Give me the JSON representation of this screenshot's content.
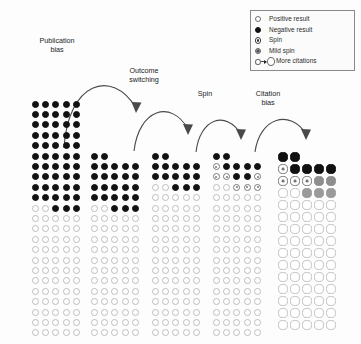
{
  "figure": {
    "title": "",
    "background": "#fdfdfd"
  },
  "legend": {
    "border_color": "#8a8a8a",
    "items": [
      {
        "icon": "open-circle-icon",
        "marker": "positive",
        "label": "Positive result"
      },
      {
        "icon": "filled-circle-icon",
        "marker": "negative",
        "label": "Negative result"
      },
      {
        "icon": "ringed-circle-icon",
        "marker": "spin",
        "label": "Spin"
      },
      {
        "icon": "gray-ringed-circle-icon",
        "marker": "mild_spin",
        "label": "Mild spin"
      },
      {
        "icon": "arrow-to-big-circle-icon",
        "marker": "more_citations",
        "label": "More citations"
      }
    ]
  },
  "stages": [
    {
      "id": "publication-bias",
      "label": "Publication\nbias",
      "x": 56,
      "y": 37
    },
    {
      "id": "outcome-switching",
      "label": "Outcome\nswitching",
      "x": 143,
      "y": 67
    },
    {
      "id": "spin",
      "label": "Spin",
      "x": 206,
      "y": 90
    },
    {
      "id": "citation-bias",
      "label": "Citation\nbias",
      "x": 263,
      "y": 90
    }
  ],
  "arrows": [
    {
      "id": "arrow-publication-bias",
      "from": "column-1",
      "to": "column-2"
    },
    {
      "id": "arrow-outcome-switching",
      "from": "column-2",
      "to": "column-3"
    },
    {
      "id": "arrow-spin",
      "from": "column-3",
      "to": "column-4"
    },
    {
      "id": "arrow-citation-bias",
      "from": "column-4",
      "to": "column-5"
    }
  ],
  "colors": {
    "negative": "#111111",
    "positive_outline": "#bdbdbd",
    "spin": "#777777",
    "mild_spin": "#8e8e8e",
    "text": "#1c1c1c"
  },
  "chart_data": {
    "type": "diagram",
    "cell_codes": {
      "n": "negative",
      "p": "positive",
      "s": "spin",
      "m": "mild_spin",
      "P": "big_positive",
      "S": "big_spin",
      "_": "empty"
    },
    "columns": [
      {
        "id": "column-1",
        "name": "all-conducted-studies",
        "x": 30,
        "y": 99,
        "cell": 10.4,
        "dot": 7.0,
        "rows": [
          "nnnnn",
          "nnnnn",
          "nnnnn",
          "nnnnn",
          "nnnnn",
          "nnnnn",
          "nnnnn",
          "nnnnn",
          "nnnnn",
          "nnnnn",
          "ppnnn",
          "ppppp",
          "ppppp",
          "ppppp",
          "ppppp",
          "ppppp",
          "ppppp",
          "ppppp",
          "ppppp",
          "ppppp",
          "ppppp",
          "ppppp",
          "ppppp"
        ]
      },
      {
        "id": "column-2",
        "name": "published-studies",
        "x": 89,
        "y": 151,
        "cell": 10.4,
        "dot": 7.0,
        "rows": [
          "nn___",
          "nnnnn",
          "nnnnn",
          "nnnnn",
          "nnnnn",
          "ppnnn",
          "ppppp",
          "ppppp",
          "ppppp",
          "ppppp",
          "ppppp",
          "ppppp",
          "ppppp",
          "ppppp",
          "ppppp",
          "ppppp",
          "ppppp",
          "ppppp"
        ]
      },
      {
        "id": "column-3",
        "name": "after-outcome-switching",
        "x": 150,
        "y": 151,
        "cell": 10.4,
        "dot": 7.0,
        "rows": [
          "nn___",
          "nnnnn",
          "nnnnn",
          "ppnnn",
          "ppppp",
          "ppppp",
          "ppppp",
          "ppppp",
          "ppppp",
          "ppppp",
          "ppppp",
          "ppppp",
          "ppppp",
          "ppppp",
          "ppppp",
          "ppppp",
          "ppppp",
          "ppppp"
        ]
      },
      {
        "id": "column-4",
        "name": "after-spin",
        "x": 211,
        "y": 151,
        "cell": 10.4,
        "dot": 7.0,
        "rows": [
          "nn___",
          "snnnn",
          "ssnns",
          "ppsss",
          "ppppp",
          "ppppp",
          "ppppp",
          "ppppp",
          "ppppp",
          "ppppp",
          "ppppp",
          "ppppp",
          "ppppp",
          "ppppp",
          "ppppp",
          "ppppp",
          "ppppp",
          "ppppp"
        ]
      },
      {
        "id": "column-5",
        "name": "after-citation-bias",
        "x": 277,
        "y": 151,
        "cell": 12.0,
        "dot": 9.2,
        "rows": [
          "nn___",
          "snnnn",
          "sssmm",
          "PPSSS",
          "PPPPP",
          "PPPPP",
          "PPPPP",
          "PPPPP",
          "PPPPP",
          "PPPPP",
          "PPPPP",
          "PPPPP",
          "PPPPP",
          "PPPPP",
          "PPPPP"
        ]
      }
    ]
  }
}
